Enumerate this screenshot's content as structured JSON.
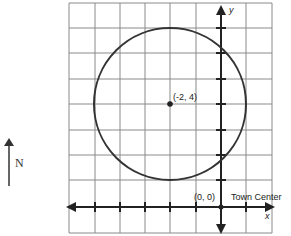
{
  "diagram": {
    "type": "coordinate-grid-circle",
    "grid": {
      "x_min": -6,
      "x_max": 2,
      "y_min": -1,
      "y_max": 8,
      "unit": 1
    },
    "axes": {
      "x_label": "x",
      "y_label": "y"
    },
    "circle": {
      "center": [
        -2,
        4
      ],
      "radius": 3
    },
    "labels": {
      "center": "(-2, 4)",
      "origin": "(0, 0)",
      "origin_name": "Town Center"
    },
    "compass": {
      "label": "N"
    }
  },
  "colors": {
    "grid": "#777777",
    "axis": "#222222",
    "circle": "#333333"
  }
}
